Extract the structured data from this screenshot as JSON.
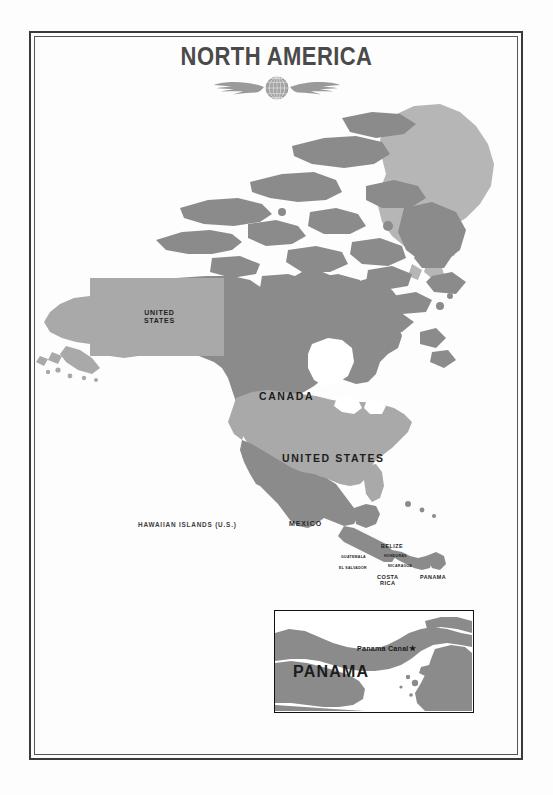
{
  "document": {
    "title": "NORTH AMERICA",
    "emblem_icon": "winged-globe-emblem",
    "frame": "double-rule-border"
  },
  "colors": {
    "canada_fill": "#8b8b8b",
    "united_states_fill": "#a9a9a9",
    "mexico_fill": "#8b8b8b",
    "central_america_fill": "#8b8b8b",
    "greenland_fill": "#b4b4b4",
    "inset_land_fill": "#8b8b8b",
    "ocean_fill": "#ffffff",
    "label_text": "#1d1d1d",
    "title_text": "#4a4a4a",
    "frame_stroke": "#3a3a3a"
  },
  "map": {
    "region": "North America",
    "projection_note": "polar-ish continental outline",
    "labels": {
      "canada": "CANADA",
      "united_states": "UNITED STATES",
      "alaska_line1": "UNITED",
      "alaska_line2": "STATES",
      "mexico": "MEXICO",
      "hawaii": "HAWAIIAN ISLANDS (U.S.)",
      "belize": "BELIZE",
      "guatemala": "GUATEMALA",
      "honduras": "HONDURAS",
      "el_salvador": "EL SALVADOR",
      "nicaragua": "NICARAGUA",
      "costa_rica_line1": "COSTA",
      "costa_rica_line2": "RICA",
      "panama": "PANAMA"
    }
  },
  "inset": {
    "name": "panama-detail-inset",
    "title": "PANAMA",
    "canal_label": "Panama Canal",
    "canal_marker": "★",
    "marker_icon": "star-marker"
  }
}
